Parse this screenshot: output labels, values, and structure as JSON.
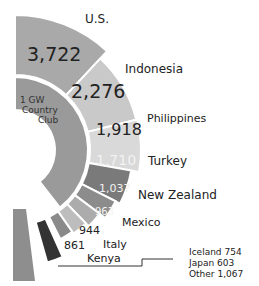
{
  "chart_data": {
    "type": "radial-bar",
    "title": "",
    "inner_ring_label": "1 GW Country Club",
    "categories": [
      "U.S.",
      "Indonesia",
      "Philippines",
      "Turkey",
      "New Zealand",
      "Mexico",
      "Italy",
      "Kenya",
      "Iceland",
      "Japan",
      "Other"
    ],
    "values": [
      3722,
      2276,
      1918,
      1710,
      1037,
      963,
      944,
      861,
      754,
      603,
      1067
    ],
    "value_labels": [
      "3,722",
      "2,276",
      "1,918",
      "1,710",
      "1,037",
      "963",
      "944",
      "861",
      "",
      "",
      ""
    ],
    "grouped_note": [
      "Iceland 754",
      "Japan 603",
      "Other 1,067"
    ],
    "colors": [
      "#a9a9a9",
      "#c9c9c9",
      "#d9d9d9",
      "#7a7a7a",
      "#8c8c8c",
      "#acacac",
      "#bdbdbd",
      "#8a8a8a",
      "#333333",
      "#8e8e8e",
      "#8e8e8e"
    ],
    "units": "MW"
  },
  "labels": {
    "us": "U.S.",
    "indonesia": "Indonesia",
    "philippines": "Philippines",
    "turkey": "Turkey",
    "new_zealand": "New Zealand",
    "mexico": "Mexico",
    "italy": "Italy",
    "kenya": "Kenya"
  },
  "values": {
    "us": "3,722",
    "indonesia": "2,276",
    "philippines": "1,918",
    "turkey": "1,710",
    "new_zealand": "1,037",
    "mexico": "963",
    "italy": "944",
    "kenya": "861"
  },
  "inner": {
    "line1": "1 GW",
    "line2": "Country",
    "line3": "Club"
  },
  "note": {
    "iceland": "Iceland 754",
    "japan": "Japan 603",
    "other": "Other 1,067"
  }
}
